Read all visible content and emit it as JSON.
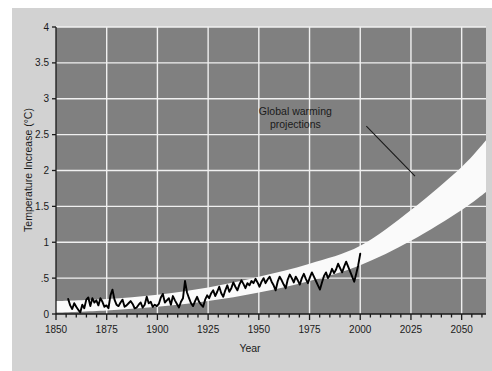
{
  "chart_data": {
    "type": "line",
    "title": "",
    "xlabel": "Year",
    "ylabel": "Temperature Increase (°C)",
    "xlim": [
      1850,
      2062
    ],
    "ylim": [
      0,
      4
    ],
    "grid": true,
    "legend_position": "none",
    "x_ticks": [
      1850,
      1875,
      1900,
      1925,
      1950,
      1975,
      2000,
      2025,
      2050
    ],
    "x_tick_labels": [
      "1850",
      "1875",
      "1900",
      "1925",
      "1950",
      "1975",
      "2000",
      "2025",
      "2050"
    ],
    "x_minor_tick_step": 5,
    "y_ticks": [
      0,
      0.5,
      1,
      1.5,
      2,
      2.5,
      3,
      3.5,
      4
    ],
    "y_tick_labels": [
      "0",
      ".5",
      "1",
      "1.5",
      "2",
      "2.5",
      "3",
      "3.5",
      "4"
    ],
    "colors": {
      "plot_background": "#808080",
      "figure_background": "#d2d2d2",
      "page_background": "#ffffff",
      "gridline": "#f0f0f0",
      "observed_line": "#000000",
      "projection_band": "#fafafa",
      "text": "#1a1a1a"
    },
    "annotations": [
      {
        "text_line1": "Global warming",
        "text_line2": "projections",
        "text_x": 1968,
        "text_y": 2.78,
        "leader_from_x": 2003,
        "leader_from_y": 2.62,
        "leader_to_x": 2027,
        "leader_to_y": 1.92
      }
    ],
    "series": [
      {
        "name": "Observed temperature increase",
        "style": "line",
        "color": "#000000",
        "x_start": 1856,
        "x_end": 2000,
        "values": [
          0.21,
          0.12,
          0.07,
          0.15,
          0.1,
          0.06,
          0.02,
          0.13,
          0.08,
          0.2,
          0.23,
          0.11,
          0.22,
          0.16,
          0.19,
          0.12,
          0.22,
          0.17,
          0.1,
          0.12,
          0.08,
          0.26,
          0.34,
          0.2,
          0.13,
          0.11,
          0.16,
          0.2,
          0.1,
          0.12,
          0.15,
          0.18,
          0.14,
          0.08,
          0.09,
          0.13,
          0.16,
          0.09,
          0.13,
          0.24,
          0.15,
          0.17,
          0.1,
          0.13,
          0.11,
          0.14,
          0.23,
          0.28,
          0.16,
          0.19,
          0.22,
          0.13,
          0.25,
          0.19,
          0.14,
          0.09,
          0.17,
          0.22,
          0.46,
          0.3,
          0.22,
          0.15,
          0.11,
          0.18,
          0.24,
          0.17,
          0.13,
          0.1,
          0.2,
          0.26,
          0.22,
          0.29,
          0.33,
          0.25,
          0.31,
          0.38,
          0.29,
          0.24,
          0.33,
          0.4,
          0.31,
          0.36,
          0.44,
          0.38,
          0.33,
          0.41,
          0.47,
          0.42,
          0.36,
          0.43,
          0.4,
          0.46,
          0.43,
          0.49,
          0.44,
          0.38,
          0.45,
          0.5,
          0.43,
          0.48,
          0.52,
          0.45,
          0.4,
          0.33,
          0.45,
          0.52,
          0.47,
          0.41,
          0.36,
          0.48,
          0.55,
          0.5,
          0.44,
          0.52,
          0.47,
          0.41,
          0.5,
          0.56,
          0.49,
          0.43,
          0.51,
          0.58,
          0.52,
          0.46,
          0.4,
          0.34,
          0.44,
          0.53,
          0.58,
          0.5,
          0.55,
          0.63,
          0.57,
          0.62,
          0.7,
          0.64,
          0.58,
          0.66,
          0.73,
          0.66,
          0.59,
          0.52,
          0.45,
          0.56,
          0.68,
          0.84
        ]
      },
      {
        "name": "Global warming projections (uncertainty band)",
        "style": "band",
        "color": "#fafafa",
        "x_start": 1850,
        "x_end": 2062,
        "upper_at_2000": 0.95,
        "upper_at_2025": 1.45,
        "upper_at_2050": 2.05,
        "upper_at_2062": 2.42,
        "lower_at_2000": 0.68,
        "lower_at_2025": 1.02,
        "lower_at_2050": 1.45,
        "lower_at_2062": 1.7,
        "upper_points": [
          [
            1850,
            0.18
          ],
          [
            1875,
            0.21
          ],
          [
            1900,
            0.27
          ],
          [
            1925,
            0.37
          ],
          [
            1950,
            0.52
          ],
          [
            1975,
            0.7
          ],
          [
            2000,
            0.95
          ],
          [
            2025,
            1.45
          ],
          [
            2050,
            2.05
          ],
          [
            2062,
            2.42
          ]
        ],
        "lower_points": [
          [
            1850,
            0.02
          ],
          [
            1875,
            0.05
          ],
          [
            1900,
            0.1
          ],
          [
            1925,
            0.18
          ],
          [
            1950,
            0.3
          ],
          [
            1975,
            0.46
          ],
          [
            2000,
            0.68
          ],
          [
            2025,
            1.02
          ],
          [
            2050,
            1.45
          ],
          [
            2062,
            1.7
          ]
        ]
      }
    ]
  }
}
